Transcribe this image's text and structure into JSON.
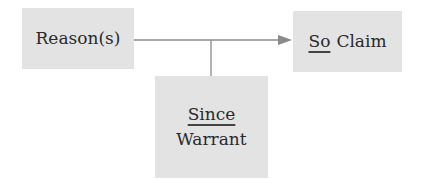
{
  "diagram": {
    "type": "argument-structure",
    "nodes": {
      "reason": {
        "label": "Reason(s)"
      },
      "claim": {
        "keyword": "So",
        "label": "Claim"
      },
      "warrant": {
        "keyword": "Since",
        "label": "Warrant"
      }
    },
    "edges": [
      {
        "from": "reason",
        "to": "claim",
        "style": "arrow"
      },
      {
        "from": "warrant",
        "to": "reason-claim-link",
        "style": "line"
      }
    ],
    "colors": {
      "box_fill": "#e3e3e3",
      "line": "#8a8a8a",
      "text": "#2a2a2a"
    }
  }
}
